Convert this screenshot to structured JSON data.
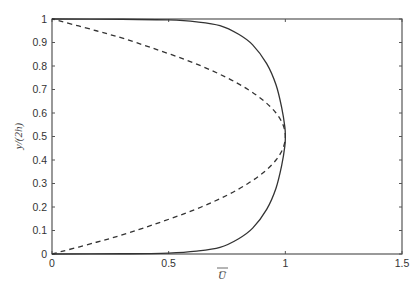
{
  "chart_data": {
    "type": "line",
    "title": "",
    "xlabel": "U̅",
    "ylabel": "y/(2h)",
    "xlim": [
      0,
      1.5
    ],
    "ylim": [
      0,
      1
    ],
    "grid": false,
    "legend": null,
    "xticks": [
      0,
      0.5,
      1,
      1.5
    ],
    "xtick_labels": [
      "0",
      "0.5",
      "1",
      "1.5"
    ],
    "yticks": [
      0,
      0.1,
      0.2,
      0.3,
      0.4,
      0.5,
      0.6,
      0.7,
      0.8,
      0.9,
      1
    ],
    "ytick_labels": [
      "0",
      "0.1",
      "0.2",
      "0.3",
      "0.4",
      "0.5",
      "0.6",
      "0.7",
      "0.8",
      "0.9",
      "1"
    ],
    "series": [
      {
        "name": "turbulent profile",
        "style": "solid",
        "color": "#333333",
        "points": [
          [
            0,
            0
          ],
          [
            0.3,
            0.001
          ],
          [
            0.5,
            0.004
          ],
          [
            0.62,
            0.012
          ],
          [
            0.72,
            0.028
          ],
          [
            0.8,
            0.065
          ],
          [
            0.86,
            0.11
          ],
          [
            0.92,
            0.19
          ],
          [
            0.96,
            0.28
          ],
          [
            0.985,
            0.38
          ],
          [
            0.998,
            0.46
          ],
          [
            1.0,
            0.5
          ],
          [
            0.998,
            0.54
          ],
          [
            0.985,
            0.62
          ],
          [
            0.96,
            0.72
          ],
          [
            0.92,
            0.81
          ],
          [
            0.86,
            0.89
          ],
          [
            0.8,
            0.935
          ],
          [
            0.72,
            0.972
          ],
          [
            0.62,
            0.988
          ],
          [
            0.5,
            0.996
          ],
          [
            0.3,
            0.999
          ],
          [
            0,
            1
          ]
        ]
      },
      {
        "name": "laminar profile",
        "style": "dashed",
        "color": "#333333",
        "points": [
          [
            0,
            0
          ],
          [
            0.19,
            0.05
          ],
          [
            0.36,
            0.1
          ],
          [
            0.64,
            0.2
          ],
          [
            0.84,
            0.3
          ],
          [
            0.96,
            0.4
          ],
          [
            1.0,
            0.5
          ],
          [
            0.96,
            0.6
          ],
          [
            0.84,
            0.7
          ],
          [
            0.64,
            0.8
          ],
          [
            0.36,
            0.9
          ],
          [
            0.19,
            0.95
          ],
          [
            0,
            1
          ]
        ]
      }
    ]
  }
}
